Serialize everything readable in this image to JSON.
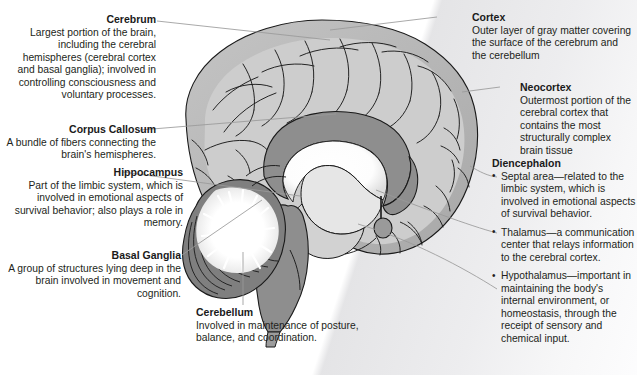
{
  "figure": {
    "title_fragment": "",
    "artwork_name": "mid-sagittal-brain-illustration",
    "colors": {
      "background": "#ffffff",
      "wash": "#e7e7e9",
      "text": "#231f20",
      "leader_line": "#8a8a8a",
      "cortex_fill": "#b9b9b9",
      "cortex_light": "#cfcfcf",
      "inner_fill": "#d6d6d6",
      "corpus_callosum": "#8e8e8e",
      "brainstem": "#8e8e8e",
      "cerebellum": "#7a7a7a",
      "ventricle_white": "#ffffff",
      "outline": "#1a1a1a"
    }
  },
  "callouts": {
    "cerebrum": {
      "heading": "Cerebrum",
      "body": "Largest portion of the brain, including the cerebral hemispheres (cerebral cortex and basal ganglia); involved in controlling consciousness and voluntary processes."
    },
    "corpus_callosum": {
      "heading": "Corpus Callosum",
      "body": "A bundle of fibers connecting the brain's hemispheres."
    },
    "hippocampus": {
      "heading": "Hippocampus",
      "body": "Part of the limbic system, which is involved in emotional aspects of survival behavior; also plays a role in memory."
    },
    "basal_ganglia": {
      "heading": "Basal Ganglia",
      "body": "A group of structures lying deep in the brain involved in movement and cognition."
    },
    "cerebellum": {
      "heading": "Cerebellum",
      "body": "Involved in maintenance of posture, balance, and coordination."
    },
    "cortex": {
      "heading": "Cortex",
      "body": "Outer layer of gray matter covering the surface of the cerebrum and the cerebellum"
    },
    "neocortex": {
      "heading": "Neocortex",
      "body": "Outermost portion of the cerebral cortex that contains the most structurally complex brain tissue"
    },
    "diencephalon": {
      "heading": "Diencephalon",
      "items": [
        "Septal area—related to the limbic system, which is involved in emotional aspects of survival behavior.",
        "Thalamus—a communication center that relays information to the cerebral cortex.",
        "Hypothalamus—important in maintaining the body's internal environment, or homeostasis, through the receipt of sensory and chemical input."
      ]
    }
  }
}
